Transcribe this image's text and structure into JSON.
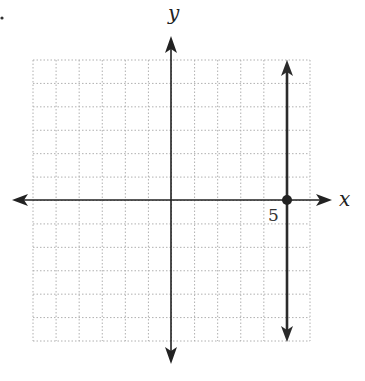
{
  "chart_data": {
    "type": "line",
    "title": "",
    "xlabel": "x",
    "ylabel": "y",
    "xlim": [
      -6,
      6
    ],
    "ylim": [
      -6,
      6
    ],
    "grid": true,
    "grid_style": "dotted",
    "tick_labels": [
      {
        "axis": "x",
        "value": 5,
        "label": "5"
      }
    ],
    "series": [
      {
        "name": "x = 5",
        "kind": "vertical_line",
        "x": 5,
        "y_range": [
          -6,
          6
        ],
        "arrows": "both",
        "points": [
          {
            "x": 5,
            "y": 0,
            "marker": "filled-circle"
          }
        ]
      }
    ],
    "legend": null,
    "colors": {
      "line": "#2b2b2b",
      "grid": "#b0b0b0",
      "axes": "#222222"
    }
  },
  "labels": {
    "x_axis": "x",
    "y_axis": "y",
    "tick_5": "5",
    "corner_mark": "."
  }
}
